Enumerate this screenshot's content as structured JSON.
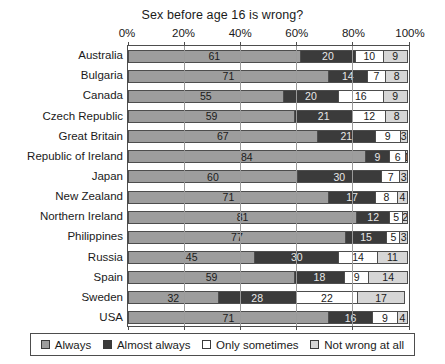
{
  "chart_data": {
    "type": "bar",
    "orientation": "horizontal",
    "stacked": true,
    "normalized_percent": true,
    "title": "Sex before age 16 is wrong?",
    "xlabel": "",
    "ylabel": "",
    "xlim": [
      0,
      100
    ],
    "xticks": [
      0,
      20,
      40,
      60,
      80,
      100
    ],
    "xtick_labels": [
      "0%",
      "20%",
      "40%",
      "60%",
      "80%",
      "100%"
    ],
    "grid": true,
    "legend_position": "bottom",
    "categories": [
      "Australia",
      "Bulgaria",
      "Canada",
      "Czech Republic",
      "Great Britain",
      "Republic of Ireland",
      "Japan",
      "New Zealand",
      "Northern Ireland",
      "Philippines",
      "Russia",
      "Spain",
      "Sweden",
      "USA"
    ],
    "series": [
      {
        "name": "Always",
        "color": "#9d9d9d",
        "values": [
          61,
          71,
          55,
          59,
          67,
          84,
          60,
          71,
          81,
          77,
          45,
          59,
          32,
          71
        ]
      },
      {
        "name": "Almost always",
        "color": "#3b3b3b",
        "values": [
          20,
          14,
          20,
          21,
          21,
          9,
          30,
          17,
          12,
          15,
          30,
          18,
          28,
          16
        ]
      },
      {
        "name": "Only sometimes",
        "color": "#ffffff",
        "values": [
          10,
          7,
          16,
          12,
          9,
          6,
          7,
          8,
          5,
          5,
          14,
          9,
          22,
          9
        ]
      },
      {
        "name": "Not wrong at all",
        "color": "#d6d6d6",
        "values": [
          9,
          8,
          9,
          8,
          3,
          1,
          3,
          4,
          2,
          3,
          11,
          14,
          17,
          4
        ]
      }
    ]
  },
  "legend": {
    "items": [
      {
        "label": "Always"
      },
      {
        "label": "Almost always"
      },
      {
        "label": "Only sometimes"
      },
      {
        "label": "Not wrong at all"
      }
    ]
  }
}
